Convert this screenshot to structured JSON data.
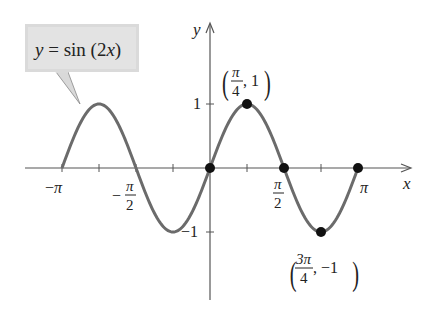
{
  "chart_data": {
    "type": "line",
    "title": "",
    "function": "y = sin (2x)",
    "xlabel": "x",
    "ylabel": "y",
    "xlim": [
      -3.14159,
      3.14159
    ],
    "ylim": [
      -1,
      1
    ],
    "grid": false,
    "legend": null,
    "x_tick_labels": [
      "−π",
      "−π/2",
      "π/2",
      "π"
    ],
    "x_tick_values": [
      -3.14159,
      -1.5708,
      1.5708,
      3.14159
    ],
    "x_minor_ticks": [
      -2.35619,
      -0.7854,
      0.7854,
      2.35619
    ],
    "y_tick_labels": [
      "1",
      "−1"
    ],
    "y_tick_values": [
      1,
      -1
    ],
    "series": [
      {
        "name": "y = sin (2x)",
        "color": "#6b6b6b",
        "x": [
          -3.14159,
          -2.35619,
          -1.5708,
          -0.7854,
          0,
          0.7854,
          1.5708,
          2.35619,
          3.14159
        ],
        "values": [
          0,
          1,
          0,
          -1,
          0,
          1,
          0,
          -1,
          0
        ]
      }
    ],
    "marked_points": [
      {
        "x": 0,
        "y": 0
      },
      {
        "x": 0.7854,
        "y": 1,
        "label": "(π/4, 1)"
      },
      {
        "x": 1.5708,
        "y": 0
      },
      {
        "x": 2.35619,
        "y": -1,
        "label": "(3π/4, −1)"
      },
      {
        "x": 3.14159,
        "y": 0
      }
    ],
    "annotations": [
      {
        "text": "y = sin (2x)",
        "type": "callout",
        "points_to": "curve near x = −3π/4"
      }
    ]
  },
  "labels": {
    "callout": {
      "y": "y",
      "eq": " = sin (2",
      "x": "x",
      "close": ")"
    },
    "axis_x": "x",
    "axis_y": "y",
    "tick_neg_pi": "−π",
    "tick_pi": "π",
    "tick_half_pi_num": "π",
    "tick_half_pi_den": "2",
    "tick_neg_sign": "−",
    "tick_y1": "1",
    "tick_yneg1": "−1",
    "peak": {
      "num": "π",
      "den": "4",
      "rest": ", 1"
    },
    "trough": {
      "num": "3π",
      "den": "4",
      "rest": ", −1"
    }
  }
}
